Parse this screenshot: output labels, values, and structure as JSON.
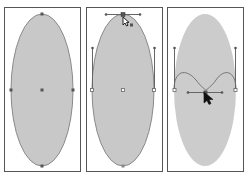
{
  "figure": {
    "colors": {
      "background": "#ffffff",
      "panel_border": "#555555",
      "ellipse_fill": "#c8c8c8",
      "ellipse_stroke": "#8a8a8a",
      "anchor": "#555555",
      "handle_line": "#666666",
      "cursor": "#111111"
    },
    "panels": [
      {
        "id": "panel-1",
        "label": "original-ellipse",
        "anchors": [
          "top",
          "left",
          "center",
          "right",
          "bottom"
        ]
      },
      {
        "id": "panel-2",
        "label": "top-anchor-selected-with-direct-selection-cursor",
        "anchors": [
          "top",
          "left",
          "center",
          "right",
          "bottom"
        ],
        "handles": [
          "top-horizontal",
          "left-vertical",
          "right-vertical"
        ],
        "cursor": "direct-selection-arrow-icon"
      },
      {
        "id": "panel-3",
        "label": "top-anchor-dragged-down-to-center",
        "anchors": [
          "left",
          "dragged-top",
          "right"
        ],
        "handles": [
          "center-horizontal",
          "left-vertical",
          "right-vertical"
        ],
        "cursor": "arrow-pointer-icon"
      }
    ]
  }
}
